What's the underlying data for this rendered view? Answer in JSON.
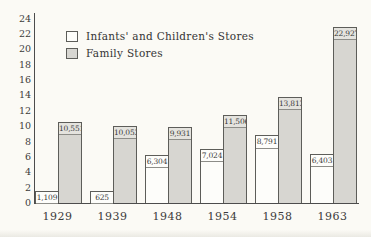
{
  "chart_data": {
    "type": "bar",
    "title": "",
    "categories": [
      "1929",
      "1939",
      "1948",
      "1954",
      "1958",
      "1963"
    ],
    "series": [
      {
        "name": "Infants' and Children's Stores",
        "values": [
          1109,
          625,
          6304,
          7024,
          8791,
          6403
        ],
        "labels": [
          "1,109",
          "625",
          "6,304",
          "7,024",
          "8,791",
          "6,403"
        ],
        "color": "#fdfdfa",
        "style": "white"
      },
      {
        "name": "Family Stores",
        "values": [
          10551,
          10053,
          9931,
          11506,
          13813,
          22927
        ],
        "labels": [
          "10,551",
          "10,053",
          "9,931",
          "11,506",
          "13,813",
          "22,927"
        ],
        "color": "#d7d6d1",
        "style": "gray"
      }
    ],
    "y_ticks": [
      0,
      2,
      4,
      6,
      8,
      10,
      12,
      14,
      16,
      18,
      20,
      22,
      24
    ],
    "ylim": [
      0,
      24
    ],
    "value_divisor_for_axis": 1000,
    "grid": false,
    "legend_position": "top-left",
    "bar_value_labels_inside_top": true
  },
  "legend": {
    "items": [
      {
        "label": "Infants' and Children's Stores",
        "swatch": "white"
      },
      {
        "label": "Family Stores",
        "swatch": "gray"
      }
    ]
  },
  "colors": {
    "background": "#fbfaf5",
    "bar_white": "#fdfdfa",
    "bar_gray": "#d7d6d1",
    "axis_line": "#4c4c4c",
    "bar_border": "#5d5d59",
    "text": "#3b3b3b"
  }
}
